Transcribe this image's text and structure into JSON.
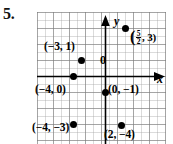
{
  "exercise": {
    "number": "5."
  },
  "figure": {
    "type": "coordinate-plane",
    "axes": {
      "x_label": "x",
      "y_label": "y",
      "origin_label": "0",
      "x_range": [
        -8,
        8
      ],
      "y_range": [
        -8,
        8
      ],
      "grid": true,
      "grid_minor_step": 0.5,
      "grid_major_step": 1
    },
    "points": [
      {
        "id": "point-neg3-1",
        "label": "(−3, 1)",
        "x": -3,
        "y": 1,
        "label_position": "above-left"
      },
      {
        "id": "point-five-halves-3",
        "label_prefix": "(",
        "label_numerator": "5",
        "label_denominator": "2",
        "label_suffix": ", 3)",
        "label": "(5/2, 3)",
        "x": 2.5,
        "y": 3,
        "label_position": "right",
        "has_fraction": true
      },
      {
        "id": "point-neg4-0",
        "label": "(−4, 0)",
        "x": -4,
        "y": 0,
        "label_position": "below"
      },
      {
        "id": "point-0-neg1",
        "label": "(0, −1)",
        "x": 0,
        "y": -1,
        "label_position": "right"
      },
      {
        "id": "point-neg4-neg3",
        "label": "(−4, −3)",
        "x": -4,
        "y": -3,
        "label_position": "below"
      },
      {
        "id": "point-2-neg4",
        "label": "(2, −4)",
        "x": 2,
        "y": -4,
        "label_position": "below-left"
      }
    ],
    "colors": {
      "point": "#000000",
      "axis": "#000000",
      "grid_major": "#787878",
      "grid_minor": "#a5a5a5",
      "background": "#ffffff"
    }
  }
}
